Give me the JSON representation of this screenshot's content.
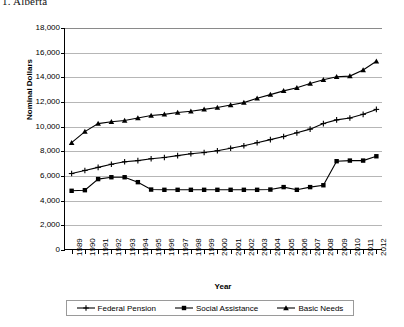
{
  "caption": "1. Alberta",
  "chart_data": {
    "type": "line",
    "title": "",
    "xlabel": "Year",
    "ylabel": "Nominal Dollars",
    "ylim": [
      0,
      18000
    ],
    "ytick_step": 2000,
    "ytick_labels": [
      "18,000",
      "16,000",
      "14,000",
      "12,000",
      "10,000",
      "8,000",
      "6,000",
      "4,000",
      "2,000",
      "0"
    ],
    "grid": true,
    "legend_position": "bottom",
    "categories": [
      1989,
      1990,
      1991,
      1992,
      1993,
      1994,
      1995,
      1996,
      1997,
      1998,
      1999,
      2000,
      2001,
      2002,
      2003,
      2004,
      2005,
      2006,
      2007,
      2008,
      2009,
      2010,
      2011,
      2012
    ],
    "series": [
      {
        "name": "Federal Pension",
        "marker": "plus",
        "values": [
          6200,
          6450,
          6700,
          6950,
          7150,
          7250,
          7400,
          7500,
          7650,
          7800,
          7900,
          8050,
          8250,
          8450,
          8700,
          8950,
          9200,
          9500,
          9800,
          10250,
          10550,
          10700,
          11000,
          11400
        ]
      },
      {
        "name": "Social Assistance",
        "marker": "square",
        "values": [
          4800,
          4850,
          5750,
          5900,
          5900,
          5500,
          4900,
          4880,
          4880,
          4880,
          4880,
          4880,
          4880,
          4880,
          4880,
          4900,
          5100,
          4880,
          5100,
          5250,
          7200,
          7250,
          7250,
          7600
        ]
      },
      {
        "name": "Basic Needs",
        "marker": "triangle",
        "values": [
          8700,
          9600,
          10250,
          10400,
          10500,
          10700,
          10900,
          11000,
          11150,
          11250,
          11400,
          11550,
          11750,
          11950,
          12300,
          12600,
          12900,
          13150,
          13500,
          13800,
          14050,
          14100,
          14600,
          15300
        ]
      }
    ]
  }
}
